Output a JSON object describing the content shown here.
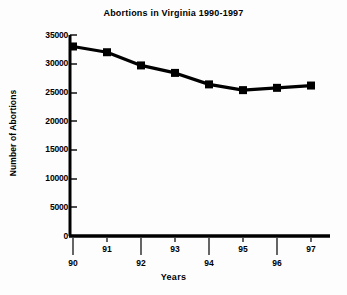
{
  "chart_data": {
    "type": "line",
    "title": "Abortions in Virginia 1990-1997",
    "xlabel": "Years",
    "ylabel": "Number of Abortions",
    "categories": [
      "90",
      "91",
      "92",
      "93",
      "94",
      "95",
      "96",
      "97"
    ],
    "values": [
      33000,
      32000,
      29700,
      28400,
      26400,
      25400,
      25800,
      26200
    ],
    "series": [
      {
        "name": "Number of Abortions",
        "values": [
          33000,
          32000,
          29700,
          28400,
          26400,
          25400,
          25800,
          26200
        ]
      }
    ],
    "ylim": [
      0,
      35000
    ],
    "ytick_labels": [
      "35000",
      "30000",
      "25000",
      "20000",
      "15000",
      "10000",
      "5000",
      "0"
    ],
    "ytick_values": [
      35000,
      30000,
      25000,
      20000,
      15000,
      10000,
      5000,
      0
    ],
    "xtick_labels": [
      "90",
      "91",
      "92",
      "93",
      "94",
      "95",
      "96",
      "97"
    ],
    "grid": false,
    "legend": "none",
    "marker": "square",
    "line_color": "#000000",
    "marker_color": "#000000",
    "background_color": "#fdfdfd"
  },
  "axis": {
    "y_title": "Number of Abortions",
    "x_title": "Years"
  }
}
